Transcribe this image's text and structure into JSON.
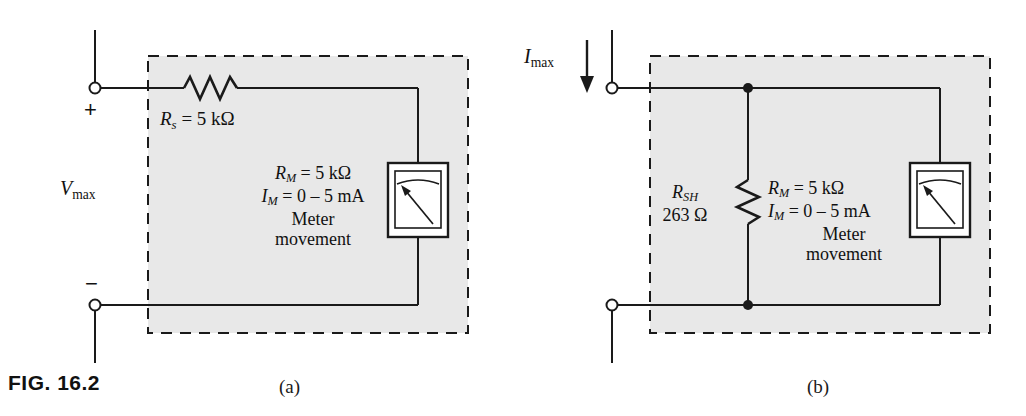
{
  "figure": {
    "caption": "FIG. 16.2",
    "panels": [
      {
        "id": "a",
        "label": "(a)"
      },
      {
        "id": "b",
        "label": "(b)"
      }
    ]
  },
  "colors": {
    "shade": "#e8e8e8",
    "line": "#1a1a1a",
    "background": "#ffffff",
    "text": "#111111"
  },
  "panel_a": {
    "source_label": {
      "symbol": "V",
      "subscript": "max"
    },
    "terminal_plus": "+",
    "terminal_minus": "−",
    "series_resistor": {
      "symbol": "R",
      "subscript": "s",
      "value": "= 5 kΩ",
      "full": "R_s = 5 kΩ"
    },
    "meter": {
      "resistance_symbol": "R",
      "resistance_subscript": "M",
      "resistance_value": "= 5 kΩ",
      "current_symbol": "I",
      "current_subscript": "M",
      "current_value": "= 0 – 5 mA",
      "name_line1": "Meter",
      "name_line2": "movement"
    }
  },
  "panel_b": {
    "source_label": {
      "symbol": "I",
      "subscript": "max"
    },
    "shunt_resistor": {
      "symbol": "R",
      "subscript": "SH",
      "value": "263 Ω"
    },
    "meter": {
      "resistance_symbol": "R",
      "resistance_subscript": "M",
      "resistance_value": "= 5 kΩ",
      "current_symbol": "I",
      "current_subscript": "M",
      "current_value": "= 0 – 5 mA",
      "name_line1": "Meter",
      "name_line2": "movement"
    }
  },
  "icons": {
    "resistor": "resistor-zigzag-icon",
    "terminal": "terminal-circle-icon",
    "junction": "junction-dot-icon",
    "meter": "analog-meter-movement-icon",
    "current_arrow": "down-arrow-icon"
  }
}
